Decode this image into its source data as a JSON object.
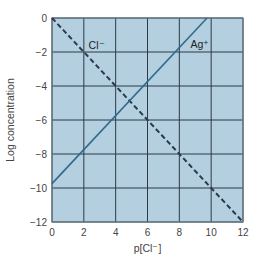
{
  "chart_data": {
    "type": "line",
    "title": "",
    "xlabel": "p[Cl⁻]",
    "ylabel": "Log concentration",
    "xlim": [
      0,
      12
    ],
    "ylim": [
      -12,
      0
    ],
    "xticks": [
      0,
      2,
      4,
      6,
      8,
      10,
      12
    ],
    "yticks": [
      0,
      -2,
      -4,
      -6,
      -8,
      -10,
      -12
    ],
    "xtick_labels": [
      "0",
      "2",
      "4",
      "6",
      "8",
      "10",
      "12"
    ],
    "ytick_labels": [
      "0",
      "−2",
      "−4",
      "−6",
      "−8",
      "−10",
      "−12"
    ],
    "grid": true,
    "legend": "inline labels",
    "series": [
      {
        "name": "Cl⁻",
        "style": "dashed",
        "color": "#2a3a48",
        "x": [
          0,
          12
        ],
        "y": [
          0,
          -12
        ],
        "label_position": [
          2.3,
          -1.6
        ]
      },
      {
        "name": "Ag⁺",
        "style": "solid",
        "color": "#2f6b8a",
        "x": [
          0,
          9.74
        ],
        "y": [
          -9.74,
          0
        ],
        "label_position": [
          8.7,
          -1.5
        ]
      }
    ],
    "colors": {
      "plot_background": "#b3cfe0",
      "grid": "#2d3a44",
      "frame": "#6c7c86"
    }
  }
}
